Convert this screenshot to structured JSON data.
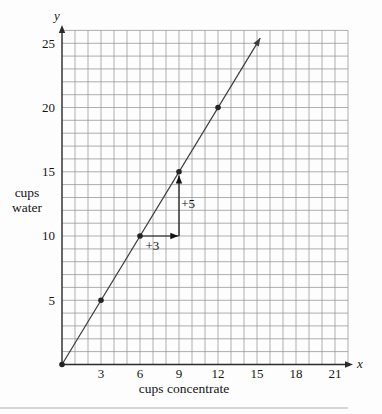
{
  "chart_data": {
    "type": "line",
    "title": "",
    "xlabel": "cups concentrate",
    "ylabel_lines": [
      "cups",
      "water"
    ],
    "x_axis_letter": "x",
    "y_axis_letter": "y",
    "xlim": [
      0,
      22
    ],
    "ylim": [
      0,
      26
    ],
    "x_ticks": [
      3,
      6,
      9,
      12,
      15,
      18,
      21
    ],
    "y_ticks": [
      5,
      10,
      15,
      20,
      25
    ],
    "grid": true,
    "grid_step": 1,
    "line": {
      "start": [
        0,
        0
      ],
      "end": [
        15.25,
        25.4
      ]
    },
    "points": [
      [
        0,
        0
      ],
      [
        3,
        5
      ],
      [
        6,
        10
      ],
      [
        9,
        15
      ],
      [
        12,
        20
      ]
    ],
    "slope_annotations": [
      {
        "label": "+3",
        "from": [
          6,
          10
        ],
        "to": [
          8.95,
          10
        ],
        "label_at": [
          6.95,
          9.25
        ]
      },
      {
        "label": "+5",
        "from": [
          9,
          10
        ],
        "to": [
          9,
          14.7
        ],
        "label_at": [
          9.7,
          12.5
        ]
      }
    ],
    "colors": {
      "grid": "#8d8d8d",
      "axis": "#2b2b2b",
      "line": "#3c3c3c",
      "point": "#242424",
      "annotation": "#141414",
      "text": "#151515",
      "separator": "#c8c8c8"
    }
  }
}
